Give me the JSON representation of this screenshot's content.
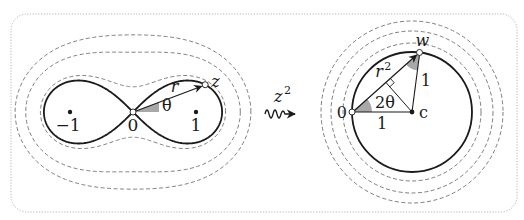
{
  "figure": {
    "border": {
      "x": 11,
      "y": 14,
      "width": 506,
      "height": 198,
      "radius": 16,
      "color": "#b5b5b5"
    },
    "left_panel": {
      "name": "z-plane",
      "origin": {
        "x": 133,
        "y": 112
      },
      "scale": 63,
      "lemniscate_level": 1,
      "contour_levels": [
        1.16,
        1.9,
        2.5
      ],
      "points": {
        "minus_one": {
          "label": "−1",
          "re": -1
        },
        "zero": {
          "label": "0",
          "re": 0
        },
        "one": {
          "label": "1",
          "re": 1
        }
      },
      "z_point": {
        "label": "z",
        "angle_deg": 20.7
      },
      "r_label": "r",
      "theta_label": "θ"
    },
    "mapping": {
      "label": "z",
      "exponent": "2"
    },
    "right_panel": {
      "name": "w-plane",
      "center": {
        "x": 412,
        "y": 112
      },
      "radius": 60,
      "contour_radii": [
        69,
        81,
        91
      ],
      "labels": {
        "zero": "0",
        "c": "c",
        "w": "w",
        "r_squared_base": "r",
        "r_squared_exp": "2",
        "two_theta": "2θ",
        "one_bottom": "1",
        "one_side": "1"
      },
      "w_angle_deg": 41.4
    },
    "colors": {
      "stroke": "#1a1a1a",
      "dashed": "#6e6e6e",
      "shade": "#a8a8a8"
    }
  }
}
